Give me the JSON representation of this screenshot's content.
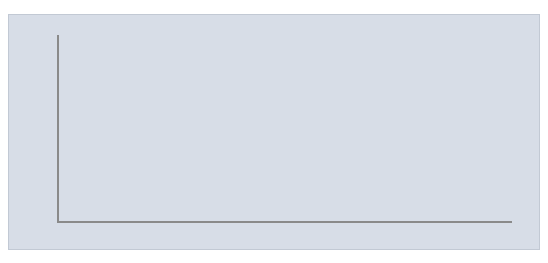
{
  "chart_data": {
    "type": "area",
    "title": "",
    "subtitle": "",
    "xlabel": "",
    "ylabel": "",
    "xlim": [
      1977,
      2010
    ],
    "ylim": [
      0,
      50
    ],
    "grid": true,
    "legend": "none",
    "y_ticks": [
      "0.00",
      "5.00",
      "10.00",
      "15.00",
      "20.00",
      "25.00",
      "30.00",
      "35.00",
      "40.00",
      "45.00",
      "50.00"
    ],
    "y_tick_values": [
      0,
      5,
      10,
      15,
      20,
      25,
      30,
      35,
      40,
      45,
      50
    ],
    "x_tick_labels": [
      "1977",
      "1979",
      "1981",
      "1983",
      "1985",
      "1987",
      "1989",
      "1991",
      "1993",
      "1995",
      "1997",
      "1999",
      "2001",
      "2003",
      "2005",
      "2007",
      "2009"
    ],
    "x": [
      1977,
      1978,
      1979,
      1980,
      1981,
      1982,
      1983,
      1984,
      1985,
      1986,
      1987,
      1988,
      1989,
      1990,
      1991,
      1992,
      1993,
      1994,
      1995,
      1996,
      1997,
      1998,
      1999,
      2000,
      2001,
      2002,
      2003,
      2004,
      2005,
      2006,
      2007,
      2008,
      2009,
      2010
    ],
    "values": [
      24.5,
      26.5,
      31.0,
      27.0,
      23.5,
      24.0,
      25.5,
      27.5,
      38.0,
      30.5,
      27.0,
      26.0,
      25.0,
      23.5,
      25.5,
      23.0,
      21.5,
      20.5,
      19.0,
      16.5,
      16.5,
      17.0,
      19.0,
      19.0,
      18.5,
      21.0,
      24.0,
      43.0,
      27.5,
      29.0,
      29.0,
      30.5,
      34.5,
      38.0
    ],
    "series_name": "U.S. foreign assistance",
    "colors": {
      "area_fill": "#b6b6b6",
      "plot_background": "#d7dde7",
      "gridline": "#ffffff",
      "axis": "#8a8a8a",
      "callout_fill": "#dcdcdc",
      "callout_border": "#8f8f8f",
      "text": "#1c1c1c"
    },
    "annotations": [
      {
        "id": "camp-david",
        "lines": [
          "Camp David",
          "Peace Accords"
        ],
        "target_year": 1979,
        "target_value": 31.0
      },
      {
        "id": "deficit-reduction",
        "lines": [
          "Deficit reduction",
          "measure enacted"
        ],
        "target_year": 1982,
        "target_value": 24.0
      },
      {
        "id": "middle-east-supplemental",
        "lines": [
          "Middle East Supplemental;",
          "military aid peaks"
        ],
        "target_year": 1985,
        "target_value": 38.0
      },
      {
        "id": "cold-war-ends",
        "lines": [
          "Cold War ends"
        ],
        "target_year": 1990,
        "target_value": 23.5
      },
      {
        "id": "first-gulf-war",
        "lines": [
          "First Gulf War"
        ],
        "target_year": 1991,
        "target_value": 25.5
      },
      {
        "id": "wye-river",
        "lines": [
          "Wye River Peace Aid;",
          "Colombia Counternarcotics"
        ],
        "target_year": 1999,
        "target_value": 19.0
      },
      {
        "id": "sept-11",
        "lines": [
          "Sept.11 terrorist attacks"
        ],
        "target_year": 2002,
        "target_value": 21.0
      },
      {
        "id": "iraq-reconstruction",
        "lines": [
          "Iraq Reconstruction"
        ],
        "target_year": 2004,
        "target_value": 43.0
      },
      {
        "id": "mcc-pepfar",
        "lines": [
          "MCC; PEPFAR"
        ],
        "target_year": 2005,
        "target_value": 27.5
      },
      {
        "id": "aid-afghanistan-pakistan",
        "lines": [
          "Aid to Afghanistan/",
          "Pakistan; GHI"
        ],
        "target_year": 2010,
        "target_value": 38.0
      }
    ]
  }
}
